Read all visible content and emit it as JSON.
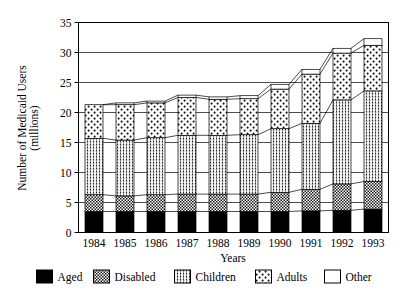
{
  "chart_data": {
    "type": "bar",
    "subtype": "stacked-bar",
    "title": "",
    "xlabel": "Years",
    "ylabel": "Number of Medicaid Users (millions)",
    "categories": [
      "1984",
      "1985",
      "1986",
      "1987",
      "1988",
      "1989",
      "1990",
      "1991",
      "1992",
      "1993"
    ],
    "ylim": [
      0,
      35
    ],
    "yticks": [
      0,
      5,
      10,
      15,
      20,
      25,
      30,
      35
    ],
    "ytick_labels": [
      "0",
      "5",
      "10",
      "15",
      "20",
      "25",
      "30",
      "35"
    ],
    "grid": true,
    "grid_axis": "y",
    "legend_position": "bottom",
    "series": [
      {
        "name": "Aged",
        "values": [
          3.5,
          3.5,
          3.5,
          3.5,
          3.5,
          3.5,
          3.5,
          3.6,
          3.7,
          3.9
        ]
      },
      {
        "name": "Disabled",
        "values": [
          2.8,
          2.6,
          2.8,
          2.9,
          2.9,
          2.9,
          3.2,
          3.6,
          4.4,
          4.6
        ]
      },
      {
        "name": "Children",
        "values": [
          9.4,
          9.3,
          9.5,
          9.8,
          9.8,
          9.9,
          10.6,
          11.0,
          14.0,
          15.1
        ]
      },
      {
        "name": "Adults",
        "values": [
          5.6,
          5.9,
          5.8,
          6.3,
          6.0,
          6.0,
          6.6,
          8.2,
          7.8,
          7.6
        ]
      },
      {
        "name": "Other",
        "values": [
          0.0,
          0.3,
          0.3,
          0.4,
          0.4,
          0.5,
          0.8,
          0.8,
          0.8,
          1.1
        ]
      }
    ],
    "totals": [
      21.3,
      21.6,
      21.9,
      22.9,
      22.6,
      22.8,
      24.7,
      27.2,
      30.7,
      32.3
    ],
    "legend": [
      "Aged",
      "Disabled",
      "Children",
      "Adults",
      "Other"
    ],
    "patterns": {
      "Aged": "solid-black",
      "Disabled": "dense-checker",
      "Children": "vertical-stripe-dots",
      "Adults": "sparse-dots",
      "Other": "white-empty"
    },
    "colors": {
      "Aged": "#000000",
      "Disabled": "#555555",
      "Children": "#a8a8a8",
      "Adults": "#e2e2e2",
      "Other": "#ffffff",
      "axis": "#000000",
      "grid": "#000000",
      "background": "#ffffff"
    }
  },
  "axis": {
    "y_title_line1": "Number of Medicaid Users",
    "y_title_line2": "(millions)",
    "x_title": "Years"
  }
}
